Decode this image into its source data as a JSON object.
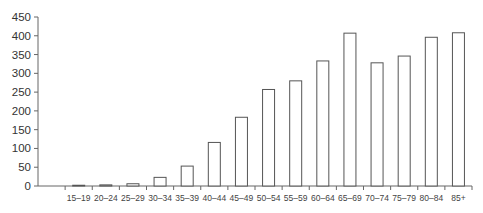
{
  "chart_data": {
    "type": "bar",
    "title": "",
    "xlabel": "",
    "ylabel": "",
    "categories": [
      "",
      "15–19",
      "20–24",
      "25–29",
      "30–34",
      "35–39",
      "40–44",
      "45–49",
      "50–54",
      "55–59",
      "60–64",
      "65–69",
      "70–74",
      "75–79",
      "80–84",
      "85+"
    ],
    "values": [
      null,
      2,
      3,
      6,
      23,
      53,
      116,
      183,
      257,
      280,
      333,
      407,
      328,
      346,
      396,
      408
    ],
    "ylim": [
      0,
      450
    ],
    "yticks": [
      0,
      50,
      100,
      150,
      200,
      250,
      300,
      350,
      400,
      450
    ],
    "grid": false,
    "legend": null,
    "bar_style": {
      "fill": "#ffffff",
      "stroke": "#555555"
    }
  }
}
